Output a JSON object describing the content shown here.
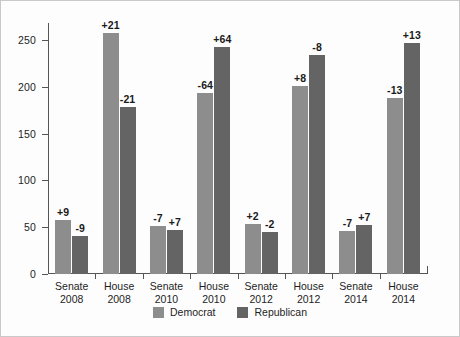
{
  "chart_data": {
    "type": "bar",
    "title": "",
    "subtitle": "",
    "xlabel": "",
    "ylabel": "",
    "categories": [
      "Senate 2008",
      "House 2008",
      "Senate 2010",
      "House 2010",
      "Senate 2012",
      "House 2012",
      "Senate 2014",
      "House 2014"
    ],
    "category_lines": [
      [
        "Senate",
        "2008"
      ],
      [
        "House",
        "2008"
      ],
      [
        "Senate",
        "2010"
      ],
      [
        "House",
        "2010"
      ],
      [
        "Senate",
        "2012"
      ],
      [
        "House",
        "2012"
      ],
      [
        "Senate",
        "2014"
      ],
      [
        "House",
        "2014"
      ]
    ],
    "series": [
      {
        "name": "Democrat",
        "color": "#8d8d8d",
        "values": [
          58,
          257,
          51,
          193,
          53,
          201,
          46,
          188
        ],
        "labels": [
          "+9",
          "+21",
          "-7",
          "-64",
          "+2",
          "+8",
          "-7",
          "-13"
        ]
      },
      {
        "name": "Republican",
        "color": "#646464",
        "values": [
          41,
          178,
          47,
          242,
          45,
          234,
          52,
          247
        ],
        "labels": [
          "-9",
          "-21",
          "+7",
          "+64",
          "-2",
          "-8",
          "+7",
          "+13"
        ]
      }
    ],
    "ylim": [
      0,
      268
    ],
    "yticks": [
      0,
      50,
      100,
      150,
      200,
      250
    ],
    "ytick_labels": [
      "0",
      "50",
      "100",
      "150",
      "200",
      "250"
    ],
    "grid": false,
    "legend": {
      "position": "bottom",
      "entries": [
        {
          "label": "Democrat",
          "color": "#8d8d8d"
        },
        {
          "label": "Republican",
          "color": "#646464"
        }
      ]
    }
  }
}
